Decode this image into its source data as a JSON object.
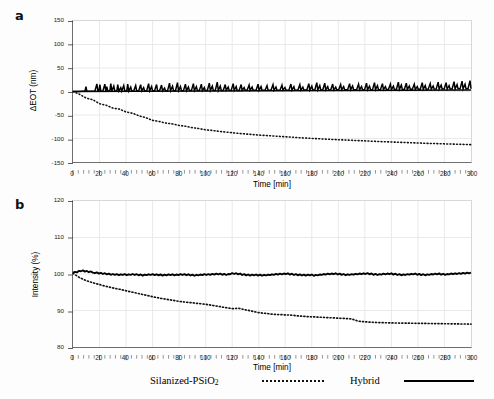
{
  "figure": {
    "background": "#fdfdfd",
    "series_colors": {
      "hybrid": "#000000",
      "silanized": "#111111"
    }
  },
  "panels": [
    {
      "label": "a",
      "xlabel": "Time [min]",
      "ylabel": "ΔEOT (nm)",
      "xticks": [
        "0",
        "20",
        "40",
        "60",
        "80",
        "100",
        "120",
        "140",
        "160",
        "180",
        "200",
        "220",
        "240",
        "260",
        "280",
        "300"
      ],
      "yticks": [
        "150",
        "100",
        "50",
        "0",
        "-50",
        "-100",
        "-150"
      ]
    },
    {
      "label": "b",
      "xlabel": "Time [min]",
      "ylabel": "Intensity (%)",
      "xticks": [
        "0",
        "20",
        "40",
        "60",
        "80",
        "100",
        "120",
        "140",
        "160",
        "180",
        "200",
        "220",
        "240",
        "260",
        "280",
        "300"
      ],
      "yticks": [
        "120",
        "110",
        "100",
        "90",
        "80"
      ]
    }
  ],
  "legend": {
    "entries": [
      {
        "label_html": "Silanized-PSiO<sub>2</sub>",
        "label": "Silanized-PSiO2",
        "style": "dotted"
      },
      {
        "label_html": "Hybrid",
        "label": "Hybrid",
        "style": "solid"
      }
    ]
  },
  "chart_data": [
    {
      "type": "line",
      "panel": "a",
      "title": "",
      "xlabel": "Time [min]",
      "ylabel": "ΔEOT (nm)",
      "xlim": [
        0,
        300
      ],
      "ylim": [
        -150,
        150
      ],
      "xticks": [
        0,
        20,
        40,
        60,
        80,
        100,
        120,
        140,
        160,
        180,
        200,
        220,
        240,
        260,
        280,
        300
      ],
      "yticks": [
        -150,
        -100,
        -50,
        0,
        50,
        100,
        150
      ],
      "grid": true,
      "legend_position": "below-figure",
      "series": [
        {
          "name": "Silanized-PSiO2",
          "style": "dotted",
          "x": [
            0,
            5,
            10,
            15,
            20,
            25,
            30,
            35,
            40,
            45,
            50,
            55,
            60,
            65,
            70,
            75,
            80,
            85,
            90,
            95,
            100,
            110,
            120,
            130,
            140,
            150,
            160,
            170,
            180,
            190,
            200,
            210,
            220,
            230,
            240,
            250,
            260,
            270,
            280,
            290,
            300
          ],
          "y": [
            0,
            -3,
            -7,
            -10,
            -13,
            -17,
            -20,
            -23,
            -26,
            -29,
            -32,
            -35,
            -38,
            -41,
            -44,
            -46,
            -48,
            -50,
            -52,
            -54,
            -56,
            -59,
            -62,
            -65,
            -67,
            -69,
            -71,
            -73,
            -74,
            -76,
            -77,
            -78,
            -79,
            -81,
            -82,
            -83,
            -84,
            -85,
            -86,
            -87,
            -88
          ]
        },
        {
          "name": "Hybrid",
          "style": "solid-noisy",
          "baseline": 1.5,
          "spike_amplitude_max": 12,
          "x": [
            0,
            10,
            20,
            30,
            40,
            50,
            60,
            70,
            80,
            90,
            100,
            110,
            120,
            130,
            140,
            150,
            160,
            170,
            180,
            190,
            200,
            210,
            220,
            230,
            240,
            250,
            260,
            270,
            280,
            290,
            300
          ],
          "y": [
            0,
            1,
            2,
            2,
            2,
            2,
            2,
            2,
            2,
            2,
            2,
            2,
            2,
            2,
            2,
            2,
            2,
            2,
            2,
            2,
            2,
            2,
            2,
            3,
            3,
            3,
            3,
            4,
            4,
            5,
            6
          ]
        }
      ]
    },
    {
      "type": "line",
      "panel": "b",
      "title": "",
      "xlabel": "Time [min]",
      "ylabel": "Intensity (%)",
      "xlim": [
        0,
        300
      ],
      "ylim": [
        80,
        120
      ],
      "xticks": [
        0,
        20,
        40,
        60,
        80,
        100,
        120,
        140,
        160,
        180,
        200,
        220,
        240,
        260,
        280,
        300
      ],
      "yticks": [
        80,
        90,
        100,
        110,
        120
      ],
      "grid": true,
      "legend_position": "below-figure",
      "series": [
        {
          "name": "Silanized-PSiO2",
          "style": "dotted",
          "x": [
            0,
            5,
            10,
            15,
            20,
            25,
            30,
            35,
            40,
            45,
            50,
            55,
            60,
            65,
            70,
            75,
            80,
            85,
            90,
            95,
            100,
            110,
            120,
            130,
            140,
            150,
            160,
            170,
            180,
            190,
            200,
            210,
            220,
            230,
            240,
            250,
            260,
            270,
            280,
            290,
            300
          ],
          "y": [
            100.2,
            99.0,
            98.2,
            97.6,
            97.1,
            96.6,
            96.2,
            95.8,
            95.4,
            95.0,
            94.6,
            94.2,
            93.8,
            93.4,
            93.1,
            92.8,
            92.5,
            92.3,
            92.1,
            91.9,
            91.7,
            91.4,
            91.1,
            90.8,
            90.5,
            90.6,
            90.2,
            89.8,
            89.4,
            89.2,
            89.0,
            88.9,
            88.8,
            88.6,
            88.5,
            87.9,
            87.4,
            87.2,
            87.0,
            86.9,
            86.8
          ]
        },
        {
          "name": "Hybrid",
          "style": "solid-noisy",
          "baseline": 100.0,
          "noise_amplitude": 0.7,
          "x": [
            0,
            10,
            20,
            30,
            40,
            50,
            60,
            70,
            80,
            90,
            100,
            110,
            120,
            130,
            140,
            150,
            160,
            170,
            180,
            190,
            200,
            210,
            220,
            230,
            240,
            250,
            260,
            270,
            280,
            290,
            300
          ],
          "y": [
            100.4,
            100.7,
            100.2,
            99.9,
            99.8,
            99.8,
            99.9,
            99.7,
            99.9,
            99.7,
            99.7,
            99.8,
            99.6,
            99.8,
            99.9,
            99.7,
            100.1,
            99.8,
            99.7,
            99.6,
            99.9,
            100.0,
            99.8,
            99.7,
            99.6,
            99.9,
            99.8,
            100.0,
            99.9,
            100.0,
            100.2
          ]
        }
      ]
    }
  ]
}
